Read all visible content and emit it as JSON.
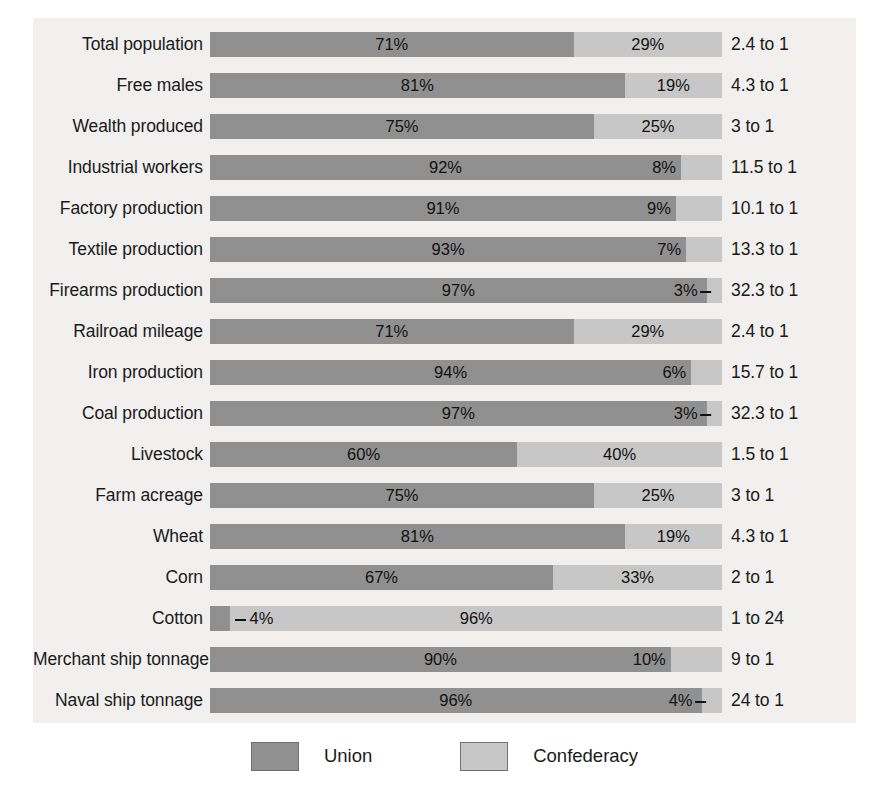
{
  "chart_data": {
    "type": "bar",
    "subtype": "100% stacked horizontal bar",
    "title": "",
    "xlabel": "",
    "ylabel": "",
    "xlim": [
      0,
      100
    ],
    "grid": false,
    "legend_position": "bottom-center",
    "legend": [
      "Union",
      "Confederacy"
    ],
    "series": [
      {
        "name": "Union",
        "color": "#909090",
        "values": [
          71,
          81,
          75,
          92,
          91,
          93,
          97,
          71,
          94,
          97,
          60,
          75,
          81,
          67,
          4,
          90,
          96
        ]
      },
      {
        "name": "Confederacy",
        "color": "#c7c7c7",
        "values": [
          29,
          19,
          25,
          8,
          9,
          7,
          3,
          29,
          6,
          3,
          40,
          25,
          19,
          33,
          96,
          10,
          4
        ]
      }
    ],
    "categories": [
      "Total population",
      "Free males",
      "Wealth produced",
      "Industrial workers",
      "Factory production",
      "Textile production",
      "Firearms production",
      "Railroad mileage",
      "Iron production",
      "Coal production",
      "Livestock",
      "Farm acreage",
      "Wheat",
      "Corn",
      "Cotton",
      "Merchant ship tonnage",
      "Naval ship tonnage"
    ],
    "annotations": [
      "2.4 to 1",
      "4.3 to 1",
      "3 to 1",
      "11.5 to 1",
      "10.1 to 1",
      "13.3 to 1",
      "32.3 to 1",
      "2.4 to 1",
      "15.7 to 1",
      "32.3 to 1",
      "1.5 to 1",
      "3 to 1",
      "4.3 to 1",
      "2 to 1",
      "1 to 24",
      "9 to 1",
      "24 to 1"
    ]
  },
  "colors": {
    "union": "#909090",
    "confederacy": "#c7c7c7",
    "panel_background": "#f1f0ee",
    "page_background": "#ffffff",
    "text": "#1a1a1a"
  },
  "rows": [
    {
      "label": "Total population",
      "union": 71,
      "confederacy": 29,
      "union_label": "71%",
      "conf_label": "29%",
      "ratio": "2.4 to 1",
      "conf_label_style": "center",
      "union_label_style": "center"
    },
    {
      "label": "Free males",
      "union": 81,
      "confederacy": 19,
      "union_label": "81%",
      "conf_label": "19%",
      "ratio": "4.3 to 1",
      "conf_label_style": "center",
      "union_label_style": "center"
    },
    {
      "label": "Wealth produced",
      "union": 75,
      "confederacy": 25,
      "union_label": "75%",
      "conf_label": "25%",
      "ratio": "3 to 1",
      "conf_label_style": "center",
      "union_label_style": "center"
    },
    {
      "label": "Industrial workers",
      "union": 92,
      "confederacy": 8,
      "union_label": "92%",
      "conf_label": "8%",
      "ratio": "11.5 to 1",
      "conf_label_style": "inside-left",
      "union_label_style": "center"
    },
    {
      "label": "Factory production",
      "union": 91,
      "confederacy": 9,
      "union_label": "91%",
      "conf_label": "9%",
      "ratio": "10.1 to 1",
      "conf_label_style": "inside-left",
      "union_label_style": "center"
    },
    {
      "label": "Textile production",
      "union": 93,
      "confederacy": 7,
      "union_label": "93%",
      "conf_label": "7%",
      "ratio": "13.3 to 1",
      "conf_label_style": "inside-left",
      "union_label_style": "center"
    },
    {
      "label": "Firearms production",
      "union": 97,
      "confederacy": 3,
      "union_label": "97%",
      "conf_label": "3%",
      "ratio": "32.3 to 1",
      "conf_label_style": "inside-left-leader",
      "union_label_style": "center"
    },
    {
      "label": "Railroad mileage",
      "union": 71,
      "confederacy": 29,
      "union_label": "71%",
      "conf_label": "29%",
      "ratio": "2.4 to 1",
      "conf_label_style": "center",
      "union_label_style": "center"
    },
    {
      "label": "Iron production",
      "union": 94,
      "confederacy": 6,
      "union_label": "94%",
      "conf_label": "6%",
      "ratio": "15.7 to 1",
      "conf_label_style": "inside-left",
      "union_label_style": "center"
    },
    {
      "label": "Coal production",
      "union": 97,
      "confederacy": 3,
      "union_label": "97%",
      "conf_label": "3%",
      "ratio": "32.3 to 1",
      "conf_label_style": "inside-left-leader",
      "union_label_style": "center"
    },
    {
      "label": "Livestock",
      "union": 60,
      "confederacy": 40,
      "union_label": "60%",
      "conf_label": "40%",
      "ratio": "1.5 to 1",
      "conf_label_style": "center",
      "union_label_style": "center"
    },
    {
      "label": "Farm acreage",
      "union": 75,
      "confederacy": 25,
      "union_label": "75%",
      "conf_label": "25%",
      "ratio": "3 to 1",
      "conf_label_style": "center",
      "union_label_style": "center"
    },
    {
      "label": "Wheat",
      "union": 81,
      "confederacy": 19,
      "union_label": "81%",
      "conf_label": "19%",
      "ratio": "4.3 to 1",
      "conf_label_style": "center",
      "union_label_style": "center"
    },
    {
      "label": "Corn",
      "union": 67,
      "confederacy": 33,
      "union_label": "67%",
      "conf_label": "33%",
      "ratio": "2 to 1",
      "conf_label_style": "center",
      "union_label_style": "center"
    },
    {
      "label": "Cotton",
      "union": 4,
      "confederacy": 96,
      "union_label": "4%",
      "conf_label": "96%",
      "ratio": "1 to 24",
      "conf_label_style": "center",
      "union_label_style": "outside-right-leader"
    },
    {
      "label": "Merchant ship tonnage",
      "union": 90,
      "confederacy": 10,
      "union_label": "90%",
      "conf_label": "10%",
      "ratio": "9 to 1",
      "conf_label_style": "inside-left",
      "union_label_style": "center"
    },
    {
      "label": "Naval ship tonnage",
      "union": 96,
      "confederacy": 4,
      "union_label": "96%",
      "conf_label": "4%",
      "ratio": "24 to 1",
      "conf_label_style": "inside-left-leader",
      "union_label_style": "center"
    }
  ],
  "legend": {
    "items": [
      {
        "label": "Union",
        "color": "#909090"
      },
      {
        "label": "Confederacy",
        "color": "#c7c7c7"
      }
    ]
  }
}
